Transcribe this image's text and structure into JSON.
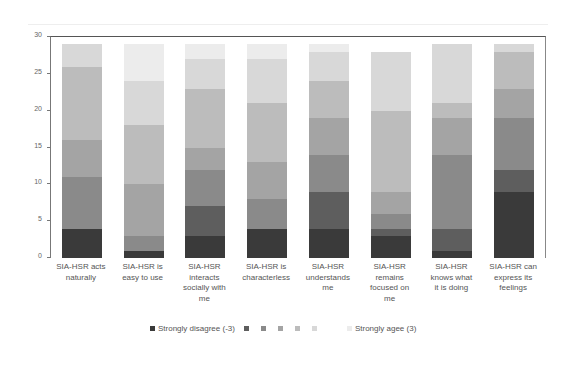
{
  "chart_data": {
    "type": "bar",
    "stacked": true,
    "title": "",
    "xlabel": "",
    "ylabel": "",
    "ylim": [
      0,
      30
    ],
    "yticks": [
      0,
      5,
      10,
      15,
      20,
      25,
      30
    ],
    "grid": false,
    "legend_position": "bottom",
    "categories": [
      "SIA-HSR acts naturally",
      "SIA-HSR is easy to use",
      "SIA-HSR interacts socially with me",
      "SIA-HSR is characterless",
      "SIA-HSR understands me",
      "SIA-HSR remains focused on me",
      "SIA-HSR knows what it is doing",
      "SIA-HSR can express its feelings"
    ],
    "series": [
      {
        "name": "Strongly disagree (-3)",
        "color": "#3a3a3a",
        "values": [
          4,
          1,
          3,
          4,
          4,
          3,
          1,
          9
        ]
      },
      {
        "name": "-2",
        "color": "#5e5e5e",
        "values": [
          0,
          0,
          4,
          0,
          5,
          1,
          3,
          3
        ]
      },
      {
        "name": "-1",
        "color": "#8a8a8a",
        "values": [
          7,
          2,
          5,
          4,
          5,
          2,
          10,
          7
        ]
      },
      {
        "name": "0",
        "color": "#a4a4a4",
        "values": [
          5,
          7,
          3,
          5,
          5,
          3,
          5,
          4
        ]
      },
      {
        "name": "1",
        "color": "#bcbcbc",
        "values": [
          10,
          8,
          8,
          8,
          5,
          11,
          2,
          5
        ]
      },
      {
        "name": "2",
        "color": "#d8d8d8",
        "values": [
          3,
          6,
          4,
          6,
          4,
          8,
          8,
          1
        ]
      },
      {
        "name": "Strongly agee (3)",
        "color": "#ececec",
        "values": [
          0,
          5,
          2,
          2,
          1,
          0,
          0,
          0
        ]
      }
    ]
  },
  "axis": {
    "y_tick_labels": [
      "30",
      "25",
      "20",
      "15",
      "10",
      "5",
      "0"
    ]
  },
  "x_labels": [
    [
      "SIA-HSR acts",
      "naturally"
    ],
    [
      "SIA-HSR is",
      "easy to use"
    ],
    [
      "SIA-HSR",
      "interacts",
      "socially with",
      "me"
    ],
    [
      "SIA-HSR is",
      "characterless"
    ],
    [
      "SIA-HSR",
      "understands",
      "me"
    ],
    [
      "SIA-HSR",
      "remains",
      "focused on",
      "me"
    ],
    [
      "SIA-HSR",
      "knows what",
      "it is doing"
    ],
    [
      "SIA-HSR can",
      "express its",
      "feelings"
    ]
  ],
  "legend": {
    "first_label": "Strongly disagree (-3)",
    "last_label": "Strongly agee (3)"
  }
}
